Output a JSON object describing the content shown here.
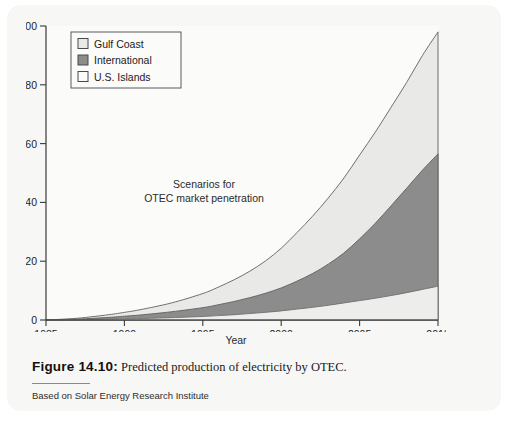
{
  "figure": {
    "caption_label": "Figure 14.10:",
    "caption_text": " Predicted production of electricity by OTEC.",
    "source": "Based on Solar Energy Research Institute"
  },
  "chart_data": {
    "type": "area",
    "title": "",
    "annotation_line1": "Scenarios for",
    "annotation_line2": "OTEC market penetration",
    "xlabel": "Year",
    "ylabel": "Cumulative capacity (GW)",
    "xlim": [
      1985,
      2010
    ],
    "ylim": [
      0,
      100
    ],
    "xticks": [
      "1985",
      "1990",
      "1995",
      "2000",
      "2005",
      "2010"
    ],
    "yticks": [
      "0",
      "20",
      "40",
      "60",
      "80",
      "100"
    ],
    "grid": false,
    "stacked": true,
    "legend_position": "top-left",
    "x": [
      1985,
      1987,
      1989,
      1990,
      1991,
      1993,
      1995,
      1996,
      1997,
      1998,
      1999,
      2000,
      2001,
      2002,
      2003,
      2004,
      2005,
      2006,
      2007,
      2008,
      2009,
      2010
    ],
    "series": [
      {
        "name": "U.S. Islands",
        "color": "#ededec",
        "values": [
          0,
          0.1,
          0.3,
          0.4,
          0.5,
          0.8,
          1.2,
          1.5,
          1.8,
          2.2,
          2.6,
          3.1,
          3.7,
          4.3,
          5.0,
          5.8,
          6.6,
          7.4,
          8.3,
          9.3,
          10.4,
          11.5
        ]
      },
      {
        "name": "International",
        "color": "#8c8c8c",
        "values": [
          0,
          0.2,
          0.6,
          0.9,
          1.2,
          2.0,
          3.0,
          3.7,
          4.5,
          5.4,
          6.5,
          7.8,
          9.5,
          11.5,
          14.0,
          17.0,
          21.0,
          25.5,
          30.5,
          35.5,
          40.5,
          45.0
        ]
      },
      {
        "name": "Gulf Coast",
        "color": "#e9e9e8",
        "values": [
          0,
          0.3,
          0.9,
          1.3,
          1.8,
          3.0,
          4.8,
          6.0,
          7.4,
          9.0,
          11.0,
          13.5,
          16.5,
          19.5,
          22.5,
          25.5,
          28.5,
          31.0,
          33.5,
          36.0,
          39.0,
          41.5
        ]
      }
    ],
    "cumulative_totals": [
      0,
      0.6,
      1.8,
      2.6,
      3.5,
      5.8,
      9.0,
      11.2,
      13.7,
      16.6,
      20.1,
      24.4,
      29.7,
      35.3,
      41.5,
      48.3,
      56.1,
      63.9,
      72.3,
      80.8,
      89.9,
      98.0
    ],
    "legend": [
      {
        "label": "Gulf Coast",
        "swatch": "#e9e9e8"
      },
      {
        "label": "International",
        "swatch": "#8c8c8c"
      },
      {
        "label": "U.S. Islands",
        "swatch": "#fbfbfb"
      }
    ]
  }
}
